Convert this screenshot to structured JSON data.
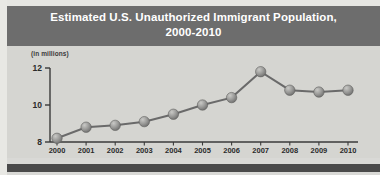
{
  "header": {
    "title_line1": "Estimated U.S. Unauthorized Immigrant Population,",
    "title_line2": "2000-2010",
    "background_color": "#6d6d6d",
    "text_color": "#ffffff"
  },
  "figure": {
    "background_color": "#d5d5d1",
    "bottom_bar_color": "#4a4a4a"
  },
  "chart_data": {
    "type": "line",
    "title": "Estimated U.S. Unauthorized Immigrant Population, 2000-2010",
    "units_note": "(in millions)",
    "xlabel": "",
    "ylabel": "",
    "categories": [
      "2000",
      "2001",
      "2002",
      "2003",
      "2004",
      "2005",
      "2006",
      "2007",
      "2008",
      "2009",
      "2010"
    ],
    "values": [
      8.2,
      8.8,
      8.9,
      9.1,
      9.5,
      10.0,
      10.4,
      11.8,
      10.8,
      10.7,
      10.8
    ],
    "ylim": [
      8,
      12
    ],
    "ytick_labels": [
      "8",
      "10",
      "12"
    ],
    "ytick_values": [
      8,
      10,
      12
    ],
    "grid": false,
    "legend": null,
    "marker_color": "#8a8a8a",
    "line_color": "#6a6a6a"
  }
}
